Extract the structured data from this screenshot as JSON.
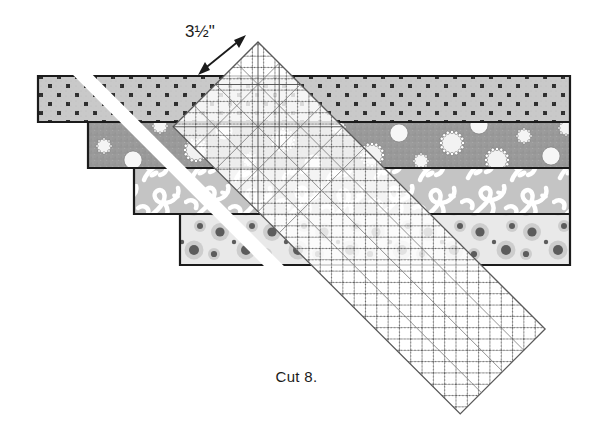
{
  "figure": {
    "title_caption": "Cut 8.",
    "measurement_label": "3½\"",
    "colors": {
      "outline": "#1b1b1b",
      "background": "#ffffff",
      "strip1_base": "#c9c9c9",
      "strip1_dots": "#303030",
      "strip2_base": "#9a9a9a",
      "strip2_circles": "#ffffff",
      "strip3_base": "#c4c4c4",
      "strip3_scroll": "#ffffff",
      "strip4_base": "#e9e9e9",
      "strip4_dots": "#5a5a5a",
      "ruler_fill": "#ffffff",
      "ruler_grid": "#6f6f6f",
      "cut_gap": "#ffffff"
    },
    "strips": [
      {
        "name": "polka-dot-strip",
        "pattern": "dark square dots on light gray",
        "top": 76,
        "bottom": 122,
        "left_step": 38,
        "right": 570
      },
      {
        "name": "ringed-circles-strip",
        "pattern": "white circles with dotted rings on medium gray",
        "top": 122,
        "bottom": 168,
        "left_step": 88,
        "right": 570
      },
      {
        "name": "floral-scroll-strip",
        "pattern": "white scrollwork floral on gray",
        "top": 168,
        "bottom": 214,
        "left_step": 134,
        "right": 570
      },
      {
        "name": "large-dot-strip",
        "pattern": "large dark dots on pale gray",
        "top": 214,
        "bottom": 265,
        "left_step": 180,
        "right": 570
      }
    ],
    "ruler": {
      "name": "rotary-cutting-ruler",
      "angle_degrees": 45,
      "grid": "diamond crosshatch with guide lines",
      "apex_x": 258,
      "apex_y": 42,
      "tip_x": 545,
      "tip_y": 330
    },
    "arrow": {
      "name": "measurement-arrow",
      "type": "double-headed",
      "from_x": 200,
      "from_y": 73,
      "to_x": 244,
      "to_y": 37
    },
    "cut_line": {
      "name": "diagonal-cut-gap",
      "angle_degrees": 45,
      "width": 14
    }
  }
}
